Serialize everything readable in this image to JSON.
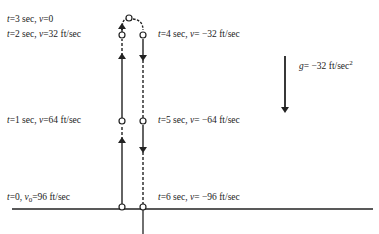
{
  "figure": {
    "gravity_label": {
      "var": "g",
      "eq": "= −32 ft/sec",
      "exp": "2"
    },
    "labels_up": [
      {
        "t": "t",
        "text": "=3 sec, ",
        "v": "v",
        "vtext": "=0"
      },
      {
        "t": "t",
        "text": "=2 sec, ",
        "v": "v",
        "vtext": "=32 ft/sec"
      },
      {
        "t": "t",
        "text": "=1 sec, ",
        "v": "v",
        "vtext": "=64 ft/sec"
      },
      {
        "t": "t",
        "text": "=0, ",
        "v": "v",
        "vsub": "0",
        "vtext": "=96 ft/sec"
      }
    ],
    "labels_down": [
      {
        "t": "t",
        "text": "=4 sec, ",
        "v": "v",
        "vtext": "= −32 ft/sec"
      },
      {
        "t": "t",
        "text": "=5 sec, ",
        "v": "v",
        "vtext": "= −64 ft/sec"
      },
      {
        "t": "t",
        "text": "=6 sec, ",
        "v": "v",
        "vtext": "= −96 ft/sec"
      }
    ],
    "colors": {
      "ink": "#222222",
      "background": "#ffffff"
    }
  }
}
